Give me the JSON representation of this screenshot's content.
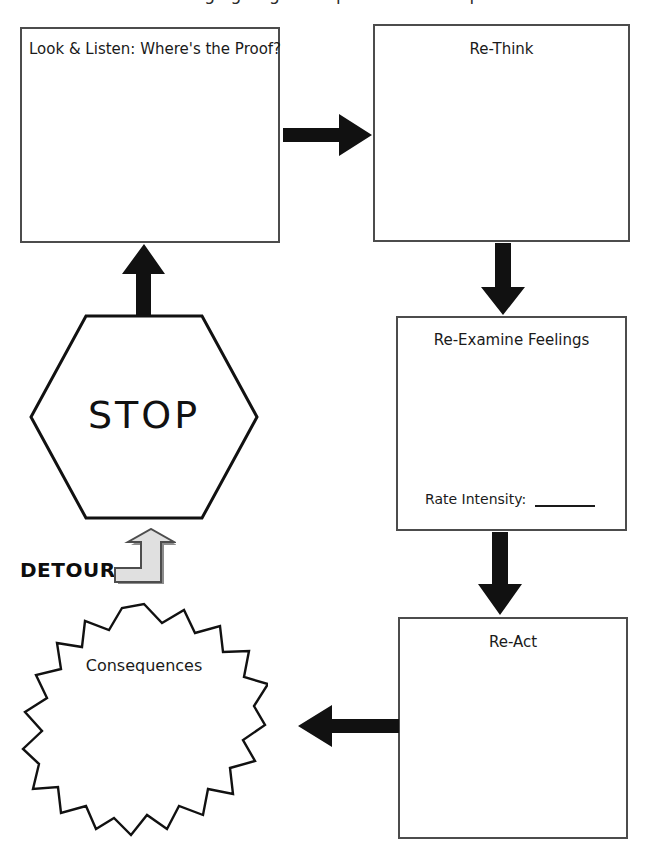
{
  "page": {
    "width": 647,
    "height": 853,
    "background": "#ffffff",
    "ink": "#1a1a1a",
    "box_border": "#4c4c4c",
    "arrow_color": "#111111",
    "detour_arrow_fill": "#d9d9d9",
    "detour_arrow_stroke": "#4d4d4d",
    "cropped_header_text": "Managing Anger: Stop and Think Steps"
  },
  "boxes": [
    {
      "id": "look-listen",
      "title": "Look & Listen: Where's the Proof?",
      "align": "left"
    },
    {
      "id": "re-think",
      "title": "Re-Think",
      "align": "center"
    },
    {
      "id": "re-examine-feelings",
      "title": "Re-Examine Feelings",
      "align": "center",
      "field_label": "Rate Intensity:",
      "field_value": ""
    },
    {
      "id": "re-act",
      "title": "Re-Act",
      "align": "center"
    }
  ],
  "shapes": {
    "stop": {
      "label": "STOP",
      "type": "hexagon"
    },
    "consequences": {
      "label": "Consequences",
      "type": "starburst",
      "points": 18
    }
  },
  "detour": {
    "label": "DETOUR",
    "icon": "bent-up-arrow-icon"
  },
  "arrows": [
    {
      "id": "look-listen-to-re-think",
      "direction": "right"
    },
    {
      "id": "re-think-to-re-examine",
      "direction": "down"
    },
    {
      "id": "re-examine-to-re-act",
      "direction": "down"
    },
    {
      "id": "re-act-to-consequences",
      "direction": "left"
    },
    {
      "id": "stop-to-look-listen",
      "direction": "up"
    }
  ]
}
